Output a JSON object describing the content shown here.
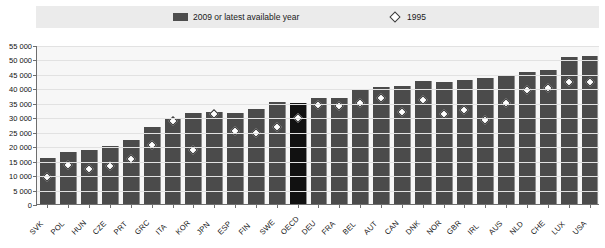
{
  "legend": {
    "entries": [
      {
        "label": "2009 or latest available year",
        "icon": "filled-square-swatch",
        "color": "#4d4d4d"
      },
      {
        "label": "1995",
        "icon": "diamond-marker",
        "color": "#ffffff"
      }
    ]
  },
  "axis": {
    "y_ticks": [
      "0",
      "5 000",
      "10 000",
      "15 000",
      "20 000",
      "25 000",
      "30 000",
      "35 000",
      "40 000",
      "45 000",
      "50 000",
      "55 000"
    ]
  },
  "colors": {
    "bar": "#4b4b4b",
    "bar_highlight": "#111111",
    "plot_background": "#f7f7f7",
    "legend_band": "#ebebeb",
    "axis": "#6e6e6e",
    "gridline": "#e2e2e2"
  },
  "chart_data": {
    "type": "bar",
    "title": "",
    "xlabel": "",
    "ylabel": "",
    "ylim": [
      0,
      55000
    ],
    "ytick_step": 5000,
    "grid": true,
    "legend_position": "top",
    "highlight_category": "OECD",
    "categories": [
      "SVK",
      "POL",
      "HUN",
      "CZE",
      "PRT",
      "GRC",
      "ITA",
      "KOR",
      "JPN",
      "ESP",
      "FIN",
      "SWE",
      "OECD",
      "DEU",
      "FRA",
      "BEL",
      "AUT",
      "CAN",
      "DNK",
      "NOR",
      "GBR",
      "IRL",
      "AUS",
      "NLD",
      "CHE",
      "LUX",
      "USA"
    ],
    "series": [
      {
        "name": "2009 or latest available year",
        "type": "bar",
        "values": [
          15800,
          18000,
          18600,
          20000,
          22100,
          26700,
          29900,
          31600,
          31800,
          31600,
          32700,
          35200,
          35100,
          36500,
          36600,
          39800,
          40600,
          40800,
          42400,
          42300,
          42800,
          43600,
          44300,
          45600,
          46300,
          51000,
          51300
        ]
      },
      {
        "name": "1995",
        "type": "scatter",
        "marker": "diamond",
        "values": [
          9500,
          13600,
          12100,
          13200,
          15700,
          20500,
          28700,
          18700,
          31200,
          25200,
          24400,
          26800,
          29900,
          34100,
          33800,
          35100,
          36500,
          31700,
          36100,
          31000,
          32600,
          29200,
          34800,
          39300,
          40300,
          42100,
          42200
        ]
      }
    ]
  }
}
